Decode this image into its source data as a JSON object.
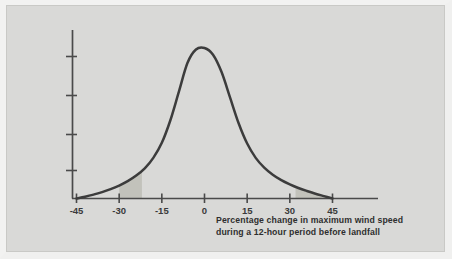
{
  "figure": {
    "background_color": "#d9d9d7",
    "frame_color": "#f2f2f1"
  },
  "caption": {
    "line1": "Percentage change in maximum wind speed",
    "line2": "during a 12-hour period before landfall"
  },
  "chart_data": {
    "type": "line",
    "title": "",
    "subtitle": "",
    "xlabel": "Percentage change in maximum wind speed during a 12-hour period before landfall",
    "ylabel": "",
    "xlim": [
      -45,
      45
    ],
    "ylim": [
      0,
      1
    ],
    "grid": false,
    "legend": null,
    "x_ticks": [
      -45,
      -30,
      -15,
      0,
      15,
      30,
      45
    ],
    "x_tick_labels": [
      "-45",
      "-30",
      "-15",
      "0",
      "15",
      "30",
      "45"
    ],
    "y_ticks": [
      0.2,
      0.4,
      0.6,
      0.8
    ],
    "y_tick_labels": [
      "",
      "",
      "",
      ""
    ],
    "curve_color": "#3c3c3c",
    "shaded_region_color": "#c2c2bb",
    "series": [
      {
        "name": "Probability density of wind speed change",
        "x": [
          -45,
          -42,
          -39,
          -36,
          -33,
          -30,
          -27,
          -24,
          -21,
          -18,
          -15,
          -12,
          -9,
          -6,
          -3,
          0,
          3,
          6,
          9,
          12,
          15,
          18,
          21,
          24,
          27,
          30,
          33,
          36,
          39,
          42,
          45
        ],
        "values": [
          0.0,
          0.012,
          0.026,
          0.042,
          0.062,
          0.086,
          0.115,
          0.152,
          0.2,
          0.27,
          0.37,
          0.52,
          0.71,
          0.9,
          0.99,
          1.0,
          0.955,
          0.84,
          0.67,
          0.5,
          0.365,
          0.27,
          0.205,
          0.158,
          0.122,
          0.094,
          0.07,
          0.05,
          0.032,
          0.016,
          0.0
        ]
      }
    ],
    "shaded_regions": [
      {
        "name": "left-tail-shaded-region",
        "x_start": -30,
        "x_end": -22
      },
      {
        "name": "right-tail-shaded-region",
        "x_start": 32,
        "x_end": 45
      }
    ],
    "annotations": []
  }
}
